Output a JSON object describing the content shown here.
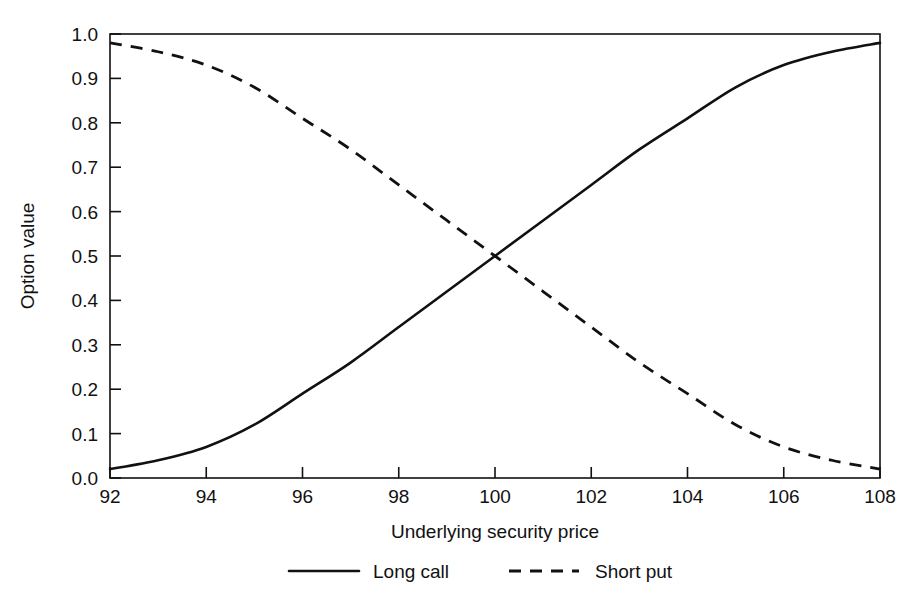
{
  "chart_data": {
    "type": "line",
    "title": "",
    "xlabel": "Underlying security price",
    "ylabel": "Option value",
    "xlim": [
      92,
      108
    ],
    "ylim": [
      0.0,
      1.0
    ],
    "grid": false,
    "legend_position": "bottom",
    "x_ticks": [
      "92",
      "94",
      "96",
      "98",
      "100",
      "102",
      "104",
      "106",
      "108"
    ],
    "y_ticks": [
      "0.0",
      "0.1",
      "0.2",
      "0.3",
      "0.4",
      "0.5",
      "0.6",
      "0.7",
      "0.8",
      "0.9",
      "1.0"
    ],
    "x": [
      92,
      93,
      94,
      95,
      96,
      97,
      98,
      99,
      100,
      101,
      102,
      103,
      104,
      105,
      106,
      107,
      108
    ],
    "series": [
      {
        "name": "Long call",
        "style": "solid",
        "color": "#111111",
        "values": [
          0.02,
          0.04,
          0.07,
          0.12,
          0.19,
          0.26,
          0.34,
          0.42,
          0.5,
          0.58,
          0.66,
          0.74,
          0.81,
          0.88,
          0.93,
          0.96,
          0.98
        ]
      },
      {
        "name": "Short put",
        "style": "dashed",
        "color": "#111111",
        "values": [
          0.98,
          0.96,
          0.93,
          0.88,
          0.81,
          0.74,
          0.66,
          0.58,
          0.5,
          0.42,
          0.34,
          0.26,
          0.19,
          0.12,
          0.07,
          0.04,
          0.02
        ]
      }
    ],
    "annotations": [
      {
        "text": "crossover at 100, 0.50",
        "x": 100,
        "y": 0.5
      }
    ]
  },
  "legend": {
    "items": [
      {
        "label": "Long call",
        "style": "solid"
      },
      {
        "label": "Short put",
        "style": "dashed"
      }
    ]
  },
  "axes": {
    "x_title": "Underlying security price",
    "y_title": "Option value"
  }
}
